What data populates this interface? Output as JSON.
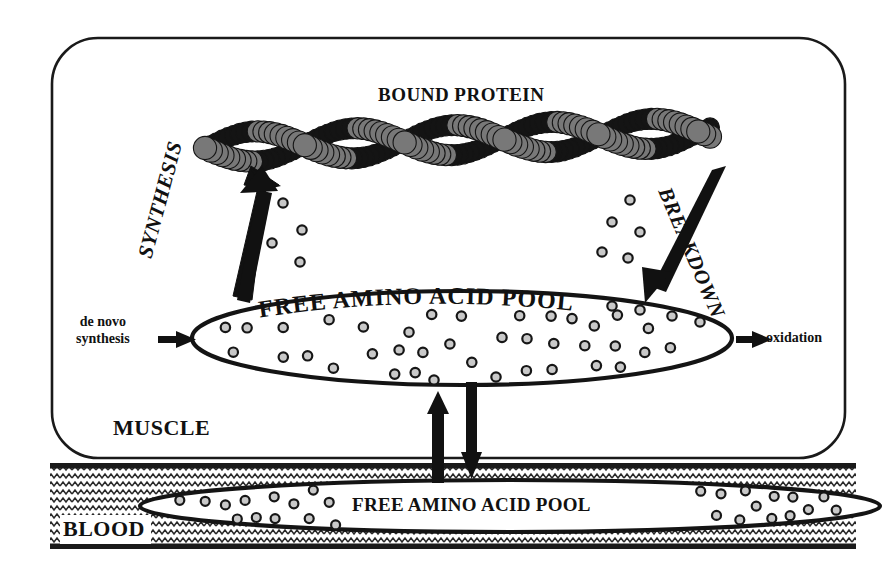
{
  "diagram": {
    "title_bound_protein": "BOUND PROTEIN",
    "compartments": {
      "muscle": "MUSCLE",
      "blood": "BLOOD"
    },
    "pools": {
      "muscle_pool_label": "FREE AMINO ACID POOL",
      "blood_pool_label": "FREE AMINO ACID POOL"
    },
    "processes": {
      "synthesis": "SYNTHESIS",
      "breakdown": "BREAKDOWN",
      "de_novo_line1": "de novo",
      "de_novo_line2": "synthesis",
      "oxidation": "oxidation"
    },
    "colors": {
      "ink": "#111111",
      "protein_dark": "#141414",
      "protein_gray": "#787878",
      "amino_acid_fill": "#c9c9c9",
      "amino_acid_stroke": "#161616",
      "blood_hatch": "#2a2a2a",
      "background": "#ffffff"
    },
    "geometry": {
      "muscle_box": {
        "x": 52,
        "y": 38,
        "w": 793,
        "h": 420,
        "radius": 46
      },
      "blood_band": {
        "x": 50,
        "y": 463,
        "w": 806,
        "h": 86
      },
      "muscle_pool_ellipse": {
        "cx": 462,
        "cy": 338,
        "rx": 270,
        "ry": 47
      },
      "blood_pool_ellipse": {
        "cx": 510,
        "cy": 506,
        "rx": 370,
        "ry": 26
      },
      "filament": {
        "x1": 205,
        "y1": 148,
        "x2": 710,
        "y2": 132
      }
    },
    "counts": {
      "muscle_pool_amino_acids": 38,
      "blood_pool_amino_acids": 26,
      "synthesis_side_amino_acids": 4,
      "breakdown_side_amino_acids": 5
    },
    "arrows": [
      {
        "name": "synthesis-arrow",
        "from": "free-amino-acid-pool",
        "to": "bound-protein",
        "direction": "up-left"
      },
      {
        "name": "breakdown-arrow",
        "from": "bound-protein",
        "to": "free-amino-acid-pool",
        "direction": "down-left"
      },
      {
        "name": "de-novo-synthesis-arrow",
        "from": "outside",
        "to": "free-amino-acid-pool",
        "direction": "right"
      },
      {
        "name": "oxidation-arrow",
        "from": "free-amino-acid-pool",
        "to": "outside",
        "direction": "right"
      },
      {
        "name": "blood-to-muscle-arrow",
        "from": "blood-pool",
        "to": "muscle-pool",
        "direction": "up"
      },
      {
        "name": "muscle-to-blood-arrow",
        "from": "muscle-pool",
        "to": "blood-pool",
        "direction": "down"
      }
    ]
  }
}
